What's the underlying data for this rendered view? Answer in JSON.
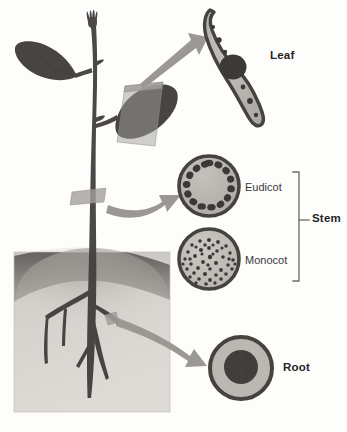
{
  "figure": {
    "width": 347,
    "height": 432,
    "background": "#fdfdfc"
  },
  "labels": {
    "leaf": "Leaf",
    "stem": "Stem",
    "root": "Root",
    "eudicot": "Eudicot",
    "monocot": "Monocot"
  },
  "colors": {
    "plant_silhouette": "#4e4b4a",
    "plant_silhouette_dark": "#403d3c",
    "soil_top": "#6e6b68",
    "soil_body": "#c9c6c1",
    "soil_light": "#d9d6d1",
    "arrow": "#9a9793",
    "cut_band": "#a8a5a1",
    "section_outline": "#4a4746",
    "section_fill": "#b4b1ad",
    "section_inner": "#c6c3bf",
    "bundle_dark": "#3e3b3a",
    "bracket": "#6d6a67",
    "text": "#252525",
    "text_regular": "#3a3a3a"
  },
  "sections": {
    "leaf": {
      "name": "leaf-cross-section",
      "shape": "curved-blade",
      "midrib": "central dark vascular bundle",
      "minor_bundles": 6,
      "center": [
        238,
        66
      ],
      "label": "Leaf"
    },
    "eudicot_stem": {
      "name": "eudicot-stem-cross-section",
      "shape": "circle",
      "center": [
        209,
        186
      ],
      "radius": 30,
      "vascular_bundles": 15,
      "arrangement": "ring near perimeter",
      "label": "Eudicot"
    },
    "monocot_stem": {
      "name": "monocot-stem-cross-section",
      "shape": "circle",
      "center": [
        209,
        259
      ],
      "radius": 30,
      "vascular_bundles": 46,
      "arrangement": "scattered throughout",
      "label": "Monocot"
    },
    "root": {
      "name": "root-cross-section",
      "shape": "concentric-circles",
      "center": [
        241,
        368
      ],
      "radius": 32,
      "stele_radius": 17,
      "layers": [
        "epidermis",
        "cortex",
        "stele"
      ],
      "label": "Root"
    }
  },
  "bracket": {
    "name": "stem-bracket",
    "spans": [
      "Eudicot",
      "Monocot"
    ],
    "label": "Stem",
    "top": 172,
    "bottom": 281,
    "x": 299
  },
  "arrows": [
    {
      "name": "leaf-arrow",
      "from": "leaf cut plane",
      "to": "leaf cross-section",
      "style": "straight-tapered"
    },
    {
      "name": "stem-arrow",
      "from": "stem cut plane",
      "to": "eudicot stem cross-section",
      "style": "curved"
    },
    {
      "name": "root-arrow",
      "from": "root cut plane",
      "to": "root cross-section",
      "style": "curved"
    }
  ],
  "cut_planes": [
    {
      "name": "leaf-cut-plane",
      "organ": "leaf"
    },
    {
      "name": "stem-cut-plane",
      "organ": "stem"
    },
    {
      "name": "root-cut-plane",
      "organ": "root"
    }
  ],
  "plant": {
    "name": "plant-silhouette",
    "parts": [
      "shoot apex",
      "upper leaf",
      "lower leaf",
      "stem",
      "taproot",
      "lateral roots"
    ],
    "soil_block": {
      "name": "soil-block",
      "x": 14,
      "y": 250,
      "width": 156,
      "height": 162
    }
  }
}
